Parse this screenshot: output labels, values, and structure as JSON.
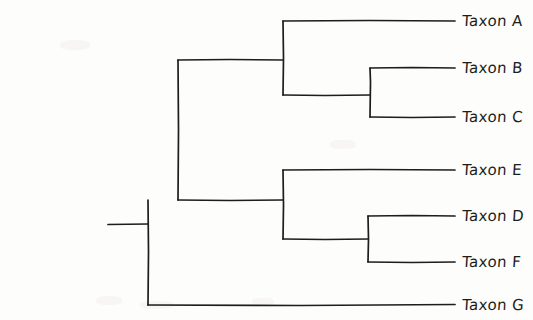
{
  "figure": {
    "kind": "phylogenetic-tree",
    "style": "hand-drawn rectangular cladogram",
    "background_color": "#fdfdfb",
    "ink_color": "#1d1d1d",
    "width": 533,
    "height": 320
  },
  "tips": [
    {
      "id": "A",
      "label": "Taxon A",
      "y": 21,
      "label_x": 462,
      "label_y": 12
    },
    {
      "id": "B",
      "label": "Taxon B",
      "y": 68,
      "label_x": 462,
      "label_y": 59
    },
    {
      "id": "C",
      "label": "Taxon C",
      "y": 117,
      "label_x": 462,
      "label_y": 108
    },
    {
      "id": "E",
      "label": "Taxon E",
      "y": 170,
      "label_x": 462,
      "label_y": 161
    },
    {
      "id": "D",
      "label": "Taxon D",
      "y": 216,
      "label_x": 462,
      "label_y": 207
    },
    {
      "id": "F",
      "label": "Taxon F",
      "y": 262,
      "label_x": 462,
      "label_y": 253
    },
    {
      "id": "G",
      "label": "Taxon G",
      "y": 305,
      "label_x": 462,
      "label_y": 296
    }
  ],
  "geometry": {
    "tip_x": 455,
    "root_stem_x_start": 108,
    "root_x": 148,
    "root_y": 224,
    "node2_x": 178,
    "upper_clade_x": 283,
    "lower_clade_x": 283,
    "bc_node_x": 370,
    "df_node_x": 368
  },
  "nodes": [
    {
      "id": "root",
      "x": 148,
      "children": [
        "node2",
        "G"
      ],
      "y_top": 200,
      "y_bottom": 305
    },
    {
      "id": "node2",
      "x": 178,
      "children": [
        "upper",
        "lower"
      ],
      "y_top": 60,
      "y_bottom": 200
    },
    {
      "id": "upper",
      "x": 283,
      "children": [
        "A",
        "bc"
      ],
      "y_top": 21,
      "y_bottom": 95
    },
    {
      "id": "bc",
      "x": 370,
      "children": [
        "B",
        "C"
      ],
      "y_top": 68,
      "y_bottom": 117
    },
    {
      "id": "lower",
      "x": 283,
      "children": [
        "E",
        "df"
      ],
      "y_top": 170,
      "y_bottom": 239
    },
    {
      "id": "df",
      "x": 368,
      "children": [
        "D",
        "F"
      ],
      "y_top": 216,
      "y_bottom": 262
    }
  ],
  "newick": "((Taxon A,(Taxon B,Taxon C)),((Taxon E,(Taxon D,Taxon F)),Taxon G));"
}
